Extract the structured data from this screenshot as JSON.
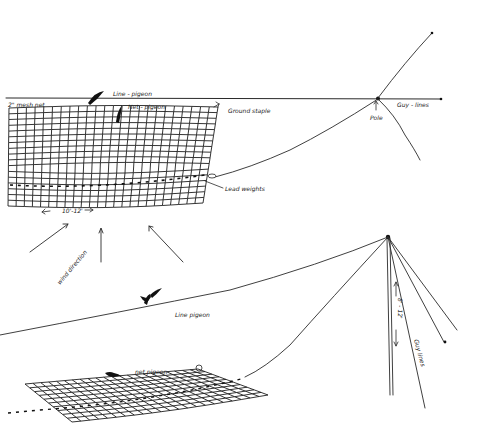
{
  "diagram": {
    "colors": {
      "ink": "#2a2a2a",
      "paper": "#ffffff"
    },
    "upper_setup": {
      "labels": {
        "line_pigeon": "Line - pigeon",
        "mesh_net": "2\" mesh net",
        "net_pigeon": "Net - pigeon",
        "ground_staple": "Ground staple",
        "pole": "Pole",
        "guy_lines": "Guy - lines",
        "lead_weights": "Lead weights",
        "net_width": "10'-12'",
        "wind_direction": "wind direction"
      }
    },
    "lower_setup": {
      "labels": {
        "line_pigeon": "Line pigeon",
        "net_pigeon": "net pigeon",
        "pole_height": "8' - 12'",
        "guy_lines": "Guy lines"
      }
    }
  }
}
